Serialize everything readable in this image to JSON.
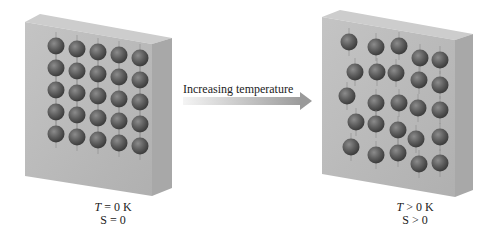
{
  "figure": {
    "arrow_label": "Increasing temperature",
    "left_state": {
      "temperature_var": "T",
      "temperature_rel": "= 0 K",
      "entropy_var": "S",
      "entropy_rel": "= 0",
      "arrangement": "perfect-lattice",
      "rows": 5,
      "cols": 5
    },
    "right_state": {
      "temperature_var": "T",
      "temperature_rel": "> 0 K",
      "entropy_var": "S",
      "entropy_rel": "> 0",
      "arrangement": "disordered-lattice",
      "rows": 5,
      "cols": 5
    },
    "colors": {
      "block_front": "#b8b8b8",
      "block_side": "#a6a6a6",
      "block_top": "#c8c8c8",
      "atom": "#5a5a5a",
      "atom_highlight": "#8c8c8c",
      "arrow_start": "#f0f0f0",
      "arrow_end": "#9a9a9a",
      "text": "#222222"
    }
  }
}
